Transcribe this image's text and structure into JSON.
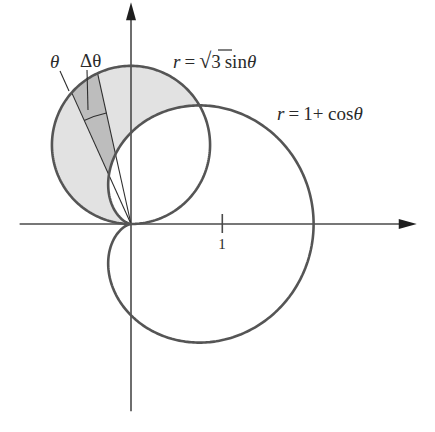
{
  "figure": {
    "labels": {
      "theta": "θ",
      "delta_theta": "Δθ",
      "circle_r": "r",
      "circle_eq": "=",
      "circle_sqrt_symbol": "√",
      "circle_sqrt_arg": "3",
      "circle_fn": "sin",
      "circle_var": "θ",
      "cardioid_r": "r",
      "cardioid_eq": "=",
      "cardioid_rhs": "1+ cos",
      "cardioid_var": "θ",
      "x_tick_1": "1"
    },
    "colors": {
      "curve": "#555555",
      "axis": "#4a4a4a",
      "ray": "#2e2e2e",
      "region_fill": "#e2e2e2",
      "wedge_fill": "#bdbdbd",
      "text": "#2a2a2a"
    }
  },
  "chart_data": {
    "type": "polar-region",
    "curves": [
      {
        "name": "circle",
        "equation": "r = √3 sin θ",
        "theta_range_deg": [
          0,
          180
        ]
      },
      {
        "name": "cardioid",
        "equation": "r = 1 + cos θ",
        "theta_range_deg": [
          0,
          360
        ]
      }
    ],
    "shaded_region": {
      "description": "inside circle, outside cardioid",
      "theta_range_deg": [
        60,
        180
      ]
    },
    "intersection": {
      "theta_deg": 60,
      "r": 1.5
    },
    "wedge": {
      "theta_deg": 102.5,
      "delta_theta_deg": 11.8,
      "arc_radius_units": 1.245
    },
    "axes": {
      "x_ticks": [
        1
      ],
      "x_range": [
        -1.22,
        3.13
      ],
      "y_range": [
        -2.05,
        2.43
      ],
      "arrows": true
    },
    "pixel_frame": {
      "origin_x": 131,
      "origin_y": 224,
      "unit_px": 91.3
    }
  }
}
